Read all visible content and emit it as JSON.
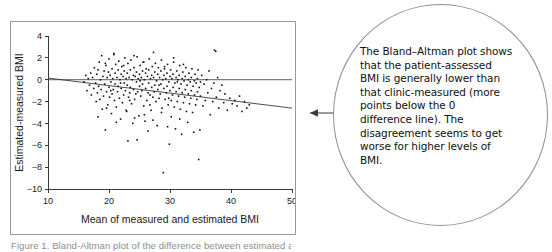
{
  "figure": {
    "caption": "Figure 1. Bland-Altman plot of the difference between estimated and measured BMI"
  },
  "callout": {
    "arrow_icon": "left-arrow-icon",
    "lines": [
      "The Bland–Altman plot shows",
      "that the patient-assessed",
      "BMI is generally lower than",
      "that clinic-measured (more",
      "points below the 0",
      "difference line). The",
      "disagreement seems to get",
      "worse for higher levels of",
      "BMI."
    ]
  },
  "chart_data": {
    "type": "scatter",
    "title": "",
    "xlabel": "Mean of measured and estimated BMI",
    "ylabel": "Estimated-measured BMI",
    "xlim": [
      10,
      50
    ],
    "ylim": [
      -10,
      4
    ],
    "xticks": [
      10,
      20,
      30,
      40,
      50
    ],
    "yticks": [
      4,
      2,
      0,
      -2,
      -4,
      -6,
      -8,
      -10
    ],
    "xtick_labels": [
      "10",
      "20",
      "30",
      "40",
      "50"
    ],
    "ytick_labels": [
      "4",
      "2",
      "0",
      "−2",
      "−4",
      "−6",
      "−8",
      "−10"
    ],
    "grid": false,
    "legend": "none",
    "reference_lines": [
      {
        "name": "zero-difference-line",
        "type": "horizontal",
        "y": 0
      },
      {
        "name": "regression-line",
        "type": "linear",
        "x1": 10,
        "y1": 0.15,
        "x2": 50,
        "y2": -2.6
      }
    ],
    "marker": {
      "shape": "square",
      "size": 1.6,
      "color": "#111111"
    },
    "n_points": 620,
    "points": [
      [
        15.9,
        -0.2
      ],
      [
        16.2,
        0.4
      ],
      [
        16.4,
        -1.0
      ],
      [
        16.6,
        0.1
      ],
      [
        16.8,
        -0.5
      ],
      [
        17.0,
        0.6
      ],
      [
        17.1,
        -1.4
      ],
      [
        17.3,
        0.2
      ],
      [
        17.5,
        -0.8
      ],
      [
        17.6,
        1.1
      ],
      [
        17.8,
        -0.3
      ],
      [
        17.9,
        -2.0
      ],
      [
        18.0,
        0.5
      ],
      [
        18.1,
        -1.2
      ],
      [
        18.2,
        0.9
      ],
      [
        18.3,
        -0.6
      ],
      [
        18.4,
        1.6
      ],
      [
        18.5,
        -1.8
      ],
      [
        18.6,
        0.0
      ],
      [
        18.7,
        -0.9
      ],
      [
        18.8,
        2.2
      ],
      [
        18.9,
        -2.7
      ],
      [
        19.0,
        0.3
      ],
      [
        19.1,
        -1.5
      ],
      [
        19.2,
        0.8
      ],
      [
        19.3,
        -0.4
      ],
      [
        19.4,
        -4.6
      ],
      [
        19.5,
        1.3
      ],
      [
        19.6,
        -1.1
      ],
      [
        19.7,
        0.2
      ],
      [
        19.8,
        -2.3
      ],
      [
        19.9,
        0.7
      ],
      [
        20.0,
        -0.7
      ],
      [
        20.0,
        1.9
      ],
      [
        20.1,
        -1.6
      ],
      [
        20.2,
        0.4
      ],
      [
        20.3,
        -0.2
      ],
      [
        20.4,
        -3.1
      ],
      [
        20.5,
        1.0
      ],
      [
        20.5,
        -1.3
      ],
      [
        20.6,
        0.1
      ],
      [
        20.7,
        -0.9
      ],
      [
        20.8,
        2.3
      ],
      [
        20.9,
        -1.9
      ],
      [
        21.0,
        0.6
      ],
      [
        21.0,
        -0.4
      ],
      [
        21.1,
        1.4
      ],
      [
        21.2,
        -2.5
      ],
      [
        21.3,
        0.2
      ],
      [
        21.4,
        -1.1
      ],
      [
        21.5,
        0.9
      ],
      [
        21.5,
        -0.6
      ],
      [
        21.6,
        1.7
      ],
      [
        21.7,
        -1.7
      ],
      [
        21.8,
        0.0
      ],
      [
        21.9,
        -3.6
      ],
      [
        22.0,
        0.5
      ],
      [
        22.0,
        -0.8
      ],
      [
        22.1,
        1.2
      ],
      [
        22.2,
        -2.1
      ],
      [
        22.3,
        0.3
      ],
      [
        22.4,
        -1.4
      ],
      [
        22.5,
        0.8
      ],
      [
        22.5,
        -0.3
      ],
      [
        22.6,
        2.0
      ],
      [
        22.7,
        -1.0
      ],
      [
        22.8,
        0.1
      ],
      [
        22.9,
        -2.9
      ],
      [
        23.0,
        0.6
      ],
      [
        23.0,
        -0.5
      ],
      [
        23.1,
        1.5
      ],
      [
        23.2,
        -1.6
      ],
      [
        23.3,
        0.2
      ],
      [
        23.4,
        -1.2
      ],
      [
        23.5,
        0.9
      ],
      [
        23.5,
        -0.7
      ],
      [
        23.6,
        1.8
      ],
      [
        23.7,
        -2.2
      ],
      [
        23.8,
        0.0
      ],
      [
        23.9,
        -4.0
      ],
      [
        24.0,
        0.4
      ],
      [
        24.0,
        -0.9
      ],
      [
        24.1,
        1.1
      ],
      [
        24.2,
        -1.8
      ],
      [
        24.3,
        0.3
      ],
      [
        24.4,
        -1.3
      ],
      [
        24.5,
        0.7
      ],
      [
        24.5,
        -0.2
      ],
      [
        24.6,
        2.1
      ],
      [
        24.7,
        -1.1
      ],
      [
        24.8,
        0.1
      ],
      [
        24.9,
        -3.3
      ],
      [
        25.0,
        0.5
      ],
      [
        25.0,
        -0.6
      ],
      [
        25.1,
        1.3
      ],
      [
        25.2,
        -1.5
      ],
      [
        25.3,
        0.2
      ],
      [
        25.4,
        -1.0
      ],
      [
        25.5,
        0.8
      ],
      [
        25.5,
        -0.4
      ],
      [
        25.6,
        1.6
      ],
      [
        25.7,
        -2.4
      ],
      [
        25.8,
        0.0
      ],
      [
        25.9,
        -3.8
      ],
      [
        26.0,
        0.6
      ],
      [
        26.0,
        -0.8
      ],
      [
        26.1,
        1.0
      ],
      [
        26.2,
        -1.9
      ],
      [
        26.3,
        0.3
      ],
      [
        26.4,
        -1.2
      ],
      [
        26.5,
        0.9
      ],
      [
        26.5,
        -0.3
      ],
      [
        26.6,
        1.9
      ],
      [
        26.7,
        -1.4
      ],
      [
        26.8,
        0.1
      ],
      [
        26.9,
        -2.8
      ],
      [
        27.0,
        0.4
      ],
      [
        27.0,
        -0.7
      ],
      [
        27.1,
        1.2
      ],
      [
        27.2,
        -1.6
      ],
      [
        27.3,
        0.2
      ],
      [
        27.4,
        -1.1
      ],
      [
        27.5,
        0.7
      ],
      [
        27.5,
        -0.5
      ],
      [
        27.6,
        1.5
      ],
      [
        27.7,
        -2.0
      ],
      [
        27.8,
        -0.1
      ],
      [
        27.9,
        -4.2
      ],
      [
        28.0,
        0.5
      ],
      [
        28.0,
        -0.9
      ],
      [
        28.1,
        1.1
      ],
      [
        28.2,
        -1.7
      ],
      [
        28.3,
        0.2
      ],
      [
        28.4,
        -1.3
      ],
      [
        28.5,
        0.8
      ],
      [
        28.5,
        -0.4
      ],
      [
        28.6,
        1.8
      ],
      [
        28.7,
        -2.6
      ],
      [
        28.8,
        0.0
      ],
      [
        28.9,
        -8.5
      ],
      [
        29.0,
        0.4
      ],
      [
        29.0,
        -0.8
      ],
      [
        29.1,
        1.0
      ],
      [
        29.2,
        -1.8
      ],
      [
        29.3,
        0.1
      ],
      [
        29.4,
        -1.2
      ],
      [
        29.5,
        0.6
      ],
      [
        29.5,
        -0.6
      ],
      [
        29.6,
        1.4
      ],
      [
        29.7,
        -2.3
      ],
      [
        29.8,
        -0.2
      ],
      [
        29.9,
        -5.9
      ],
      [
        30.0,
        0.3
      ],
      [
        30.0,
        -1.0
      ],
      [
        30.1,
        0.9
      ],
      [
        30.2,
        -1.9
      ],
      [
        30.3,
        0.1
      ],
      [
        30.4,
        -1.4
      ],
      [
        30.5,
        0.5
      ],
      [
        30.5,
        -0.7
      ],
      [
        30.6,
        1.6
      ],
      [
        30.7,
        -2.5
      ],
      [
        30.8,
        -0.3
      ],
      [
        30.9,
        -4.5
      ],
      [
        31.0,
        0.2
      ],
      [
        31.0,
        -1.1
      ],
      [
        31.1,
        0.8
      ],
      [
        31.2,
        -2.0
      ],
      [
        31.3,
        0.0
      ],
      [
        31.4,
        -1.5
      ],
      [
        31.5,
        0.4
      ],
      [
        31.5,
        -0.8
      ],
      [
        31.6,
        1.3
      ],
      [
        31.7,
        -2.7
      ],
      [
        31.8,
        -0.4
      ],
      [
        31.9,
        -5.0
      ],
      [
        32.0,
        0.1
      ],
      [
        32.0,
        -1.2
      ],
      [
        32.1,
        0.7
      ],
      [
        32.2,
        -2.1
      ],
      [
        32.3,
        -0.1
      ],
      [
        32.4,
        -1.6
      ],
      [
        32.5,
        0.3
      ],
      [
        32.5,
        -0.9
      ],
      [
        32.6,
        1.1
      ],
      [
        32.7,
        -2.9
      ],
      [
        32.8,
        -0.5
      ],
      [
        32.9,
        -3.9
      ],
      [
        33.0,
        0.0
      ],
      [
        33.0,
        -1.3
      ],
      [
        33.1,
        0.6
      ],
      [
        33.2,
        -2.2
      ],
      [
        33.3,
        -0.2
      ],
      [
        33.4,
        -1.7
      ],
      [
        33.5,
        0.2
      ],
      [
        33.5,
        -1.0
      ],
      [
        33.6,
        1.0
      ],
      [
        33.7,
        -3.0
      ],
      [
        33.8,
        -0.6
      ],
      [
        33.9,
        -4.8
      ],
      [
        34.0,
        -0.1
      ],
      [
        34.0,
        -1.4
      ],
      [
        34.1,
        0.5
      ],
      [
        34.2,
        -2.3
      ],
      [
        34.3,
        -0.3
      ],
      [
        34.4,
        -1.8
      ],
      [
        34.5,
        0.1
      ],
      [
        34.5,
        -1.1
      ],
      [
        34.6,
        0.9
      ],
      [
        34.7,
        -7.3
      ],
      [
        34.8,
        -0.7
      ],
      [
        34.9,
        -4.6
      ],
      [
        35.0,
        -0.2
      ],
      [
        35.0,
        -1.5
      ],
      [
        35.2,
        0.4
      ],
      [
        35.4,
        -2.4
      ],
      [
        35.6,
        -0.4
      ],
      [
        35.8,
        -1.9
      ],
      [
        36.0,
        0.0
      ],
      [
        36.2,
        -1.2
      ],
      [
        36.4,
        0.8
      ],
      [
        36.6,
        -3.2
      ],
      [
        36.8,
        -0.8
      ],
      [
        37.0,
        -2.0
      ],
      [
        37.2,
        -0.3
      ],
      [
        37.3,
        2.7
      ],
      [
        37.5,
        2.6
      ],
      [
        37.6,
        -1.6
      ],
      [
        37.8,
        0.2
      ],
      [
        38.0,
        -2.6
      ],
      [
        38.2,
        -1.0
      ],
      [
        38.5,
        -0.5
      ],
      [
        38.8,
        -2.1
      ],
      [
        39.0,
        -1.3
      ],
      [
        39.4,
        -2.8
      ],
      [
        39.8,
        -1.7
      ],
      [
        40.2,
        -2.2
      ],
      [
        40.6,
        -1.9
      ],
      [
        41.0,
        -2.4
      ],
      [
        41.4,
        -1.5
      ],
      [
        41.8,
        -2.9
      ],
      [
        42.2,
        -2.0
      ],
      [
        42.6,
        -2.6
      ],
      [
        43.0,
        -2.3
      ],
      [
        18.2,
        -3.4
      ],
      [
        19.6,
        -2.6
      ],
      [
        21.2,
        -3.9
      ],
      [
        22.8,
        -2.8
      ],
      [
        24.2,
        -3.5
      ],
      [
        25.8,
        -3.2
      ],
      [
        27.2,
        -3.7
      ],
      [
        28.6,
        -3.0
      ],
      [
        30.2,
        -3.4
      ],
      [
        31.6,
        -3.6
      ],
      [
        23.1,
        -5.6
      ],
      [
        24.6,
        -5.5
      ],
      [
        26.4,
        -4.7
      ],
      [
        29.6,
        -4.3
      ],
      [
        20.3,
        -1.0
      ],
      [
        21.9,
        -0.3
      ],
      [
        23.4,
        -1.9
      ],
      [
        25.1,
        -0.1
      ],
      [
        26.7,
        -2.3
      ],
      [
        28.2,
        -0.5
      ],
      [
        29.8,
        -1.7
      ],
      [
        31.2,
        -0.2
      ],
      [
        19.4,
        1.5
      ],
      [
        20.8,
        2.4
      ],
      [
        22.4,
        1.3
      ],
      [
        24.1,
        2.2
      ],
      [
        25.7,
        1.6
      ],
      [
        27.3,
        2.5
      ],
      [
        29.1,
        1.2
      ],
      [
        30.6,
        2.0
      ],
      [
        32.2,
        1.4
      ]
    ]
  }
}
